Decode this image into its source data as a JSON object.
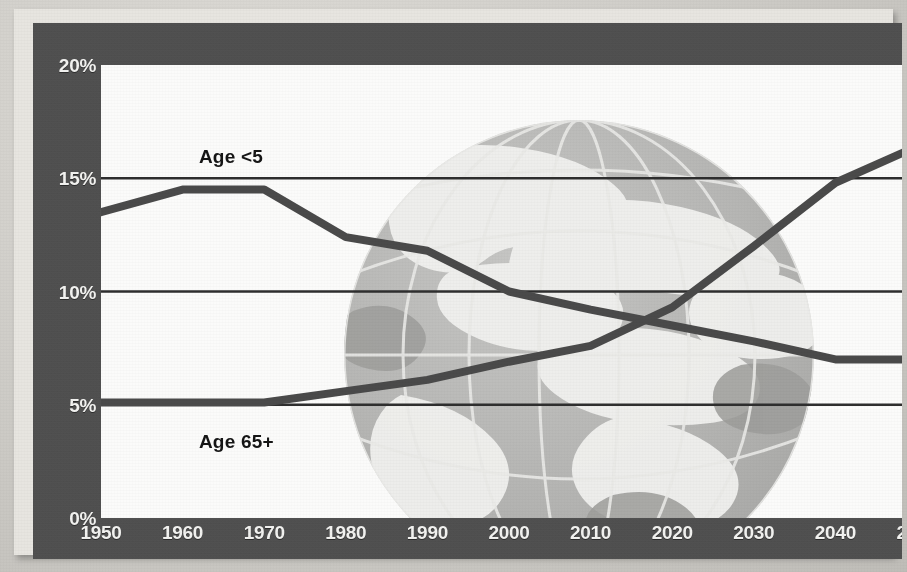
{
  "chart_data": {
    "type": "line",
    "title": "",
    "subtitle": "",
    "xlabel": "",
    "ylabel": "",
    "x": [
      1950,
      1960,
      1970,
      1980,
      1990,
      2000,
      2010,
      2020,
      2030,
      2040,
      2050
    ],
    "categories": [
      "1950",
      "1960",
      "1970",
      "1980",
      "1990",
      "2000",
      "2010",
      "2020",
      "2030",
      "2040",
      "2050"
    ],
    "xlim": [
      1950,
      2050
    ],
    "ylim": [
      0,
      20
    ],
    "yticks": [
      0,
      5,
      10,
      15,
      20
    ],
    "ytick_labels": [
      "0%",
      "5%",
      "10%",
      "15%",
      "20%"
    ],
    "grid": "horizontal",
    "legend_position": "inline-annotation",
    "value_unit": "percent of world population",
    "series": [
      {
        "name": "Age <5",
        "label": "Age <5",
        "color": "#4a4a4a",
        "annotation_x": 1962,
        "annotation_y": 16.4,
        "values": [
          13.5,
          14.5,
          14.5,
          12.4,
          11.8,
          10.0,
          9.2,
          8.5,
          7.8,
          7.0,
          7.0
        ]
      },
      {
        "name": "Age 65+",
        "label": "Age 65+",
        "color": "#4a4a4a",
        "annotation_x": 1962,
        "annotation_y": 3.8,
        "values": [
          5.1,
          5.1,
          5.1,
          5.6,
          6.1,
          6.9,
          7.6,
          9.3,
          12.0,
          14.8,
          16.4
        ]
      }
    ],
    "annotations": [
      {
        "text": "Age <5",
        "x": 1962,
        "y": 16.4
      },
      {
        "text": "Age 65+",
        "x": 1962,
        "y": 3.8
      }
    ],
    "crossover": {
      "x": 2016,
      "y": 8.7
    }
  },
  "frame": {
    "band_color": "#4d4d4d",
    "plot_background": "#fbfbfa",
    "gridline_color": "#2e2e2e",
    "line_color": "#4a4a4a",
    "tick_label_color": "#f2f2f0"
  },
  "watermark": {
    "name": "globe-watermark",
    "description": "Grayscale globe with graticule lines and continents",
    "fill": "#b7b7b7",
    "land_fill": "#f0f0ee",
    "graticule": "#e4e4e2"
  }
}
